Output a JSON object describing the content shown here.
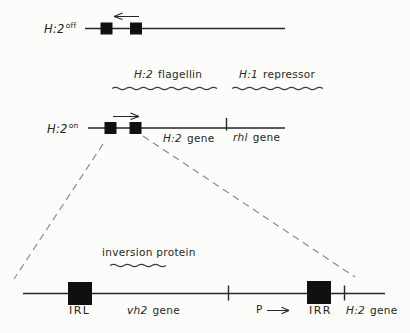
{
  "colors": {
    "background": "#fcfcfa",
    "ink": "#262626",
    "box_fill": "#101010",
    "dash": "#8c8c8c"
  },
  "rows": {
    "off_state": {
      "label": {
        "base": "H:2",
        "sup": "off"
      },
      "transcription_arrow": "left"
    },
    "products": {
      "flagellin": {
        "italic": "H:2",
        "rest": "flagellin"
      },
      "repressor": {
        "italic": "H:1",
        "rest": "repressor"
      }
    },
    "on_state": {
      "label": {
        "base": "H:2",
        "sup": "on"
      },
      "transcription_arrow": "right",
      "h2_gene": {
        "italic": "H:2",
        "rest": "gene"
      },
      "rhl_gene": {
        "italic": "rhl",
        "rest": "gene"
      }
    },
    "expanded": {
      "protein": "inversion protein",
      "irl": "IRL",
      "vh2_gene": {
        "italic": "vh2",
        "rest": "gene"
      },
      "promoter": "P",
      "irr": "IRR",
      "h2_gene": {
        "italic": "H:2",
        "rest": "gene"
      }
    }
  }
}
